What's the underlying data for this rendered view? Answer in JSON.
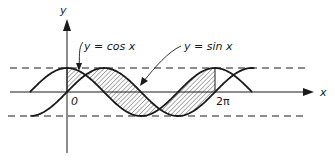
{
  "figure": {
    "type": "function-graph",
    "axes": {
      "x_label": "x",
      "y_label": "y",
      "origin_label": "0",
      "x_tick_label": "2π"
    },
    "curves": [
      {
        "id": "cos",
        "label": "y = cos x",
        "function": "cos"
      },
      {
        "id": "sin",
        "label": "y = sin x",
        "function": "sin"
      }
    ],
    "bounds": {
      "upper": 1,
      "lower": -1
    },
    "x_domain": {
      "from": "-π/2",
      "to": "5π/2"
    },
    "shaded_region": {
      "description": "area between y = sin x and y = cos x",
      "from": "0",
      "to": "2π"
    },
    "colors": {
      "ink": "#1a1a1a",
      "background": "#ffffff"
    }
  }
}
